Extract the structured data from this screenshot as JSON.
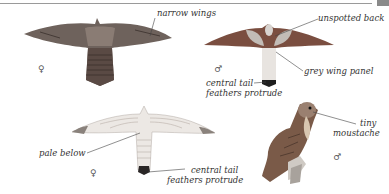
{
  "labels": {
    "narrow_wings": "narrow wings",
    "unspotted_back": "unspotted back",
    "grey_wing_panel": "grey wing panel",
    "central_tail_1_line1": "central tail",
    "central_tail_1_line2": "feathers protrude",
    "pale_below": "pale below",
    "central_tail_2_line1": "central tail",
    "central_tail_2_line2": "feathers protrude",
    "tiny_line1": "tiny",
    "tiny_line2": "moustache"
  },
  "symbols": {
    "female_top": "♀",
    "male_top": "♂",
    "female_bottom": "♀",
    "male_bottom": "♂"
  },
  "colors": {
    "female_upper": "#7a6a62",
    "male_wing": "#8a5a48",
    "male_panel": "#b8b2ae",
    "tail_dark": "#2a2a2a",
    "underside": "#e6e2de"
  }
}
